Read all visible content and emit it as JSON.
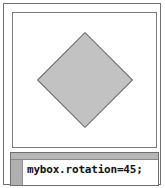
{
  "window": {
    "frame_color": "#6f6f6f",
    "background": "#ffffff"
  },
  "stage": {
    "name": "stage-canvas",
    "background": "#ffffff",
    "border_color": "#7a7a7a",
    "shape": {
      "type": "square",
      "label": "mybox",
      "rotation_degrees": "45",
      "fill_color": "#c2c2c2",
      "stroke_color": "#6b6b6b"
    }
  },
  "code_panel": {
    "titlebar_color": "#b6b6b6",
    "gutter_color": "#b0b0b0",
    "background": "#ffffff",
    "lines": [
      "mybox.rotation=45;"
    ],
    "line_1": "mybox.rotation=45;"
  }
}
